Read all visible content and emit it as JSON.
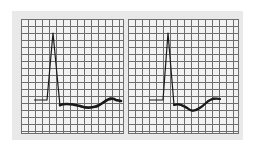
{
  "figure": {
    "colors": {
      "grid_line": "#6e6e6e",
      "grid_bg": "#f2f2f2",
      "panel_bg": "#e9e9e9",
      "trace": "#1a1a1a"
    },
    "panels": [
      {
        "id": "left",
        "label": "",
        "trace_points": "34,100 47,100 53,33 60,106 62,104 72,104 85,108 97,107 110,98 116,100 121,101"
      },
      {
        "id": "right",
        "label": "",
        "trace_points": "149,100 163,100 168,33 174,105 178,104 186,108 193,111 202,106 213,98 220,99"
      }
    ]
  }
}
